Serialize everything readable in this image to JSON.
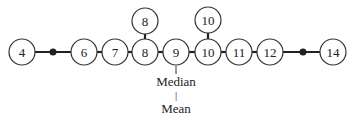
{
  "diagram": {
    "nodes": [
      {
        "id": "n4",
        "label": "4",
        "x": 22,
        "y": 52
      },
      {
        "id": "n6",
        "label": "6",
        "x": 84,
        "y": 52
      },
      {
        "id": "n7",
        "label": "7",
        "x": 115,
        "y": 52
      },
      {
        "id": "n8",
        "label": "8",
        "x": 145,
        "y": 52
      },
      {
        "id": "n8top",
        "label": "8",
        "x": 145,
        "y": 21
      },
      {
        "id": "n9",
        "label": "9",
        "x": 176,
        "y": 52
      },
      {
        "id": "n10",
        "label": "10",
        "x": 208,
        "y": 52
      },
      {
        "id": "n10top",
        "label": "10",
        "x": 208,
        "y": 20
      },
      {
        "id": "n11",
        "label": "11",
        "x": 239,
        "y": 52
      },
      {
        "id": "n12",
        "label": "12",
        "x": 270,
        "y": 52
      },
      {
        "id": "n14",
        "label": "14",
        "x": 333,
        "y": 52
      }
    ],
    "dots": [
      {
        "id": "dot-left",
        "x": 53,
        "y": 52
      },
      {
        "id": "dot-right",
        "x": 303,
        "y": 52
      }
    ],
    "annotations": {
      "median": "Median",
      "separator": "|",
      "mean": "Mean"
    }
  }
}
